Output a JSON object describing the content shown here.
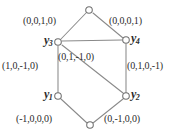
{
  "figure": {
    "type": "labeled-graph-diagram",
    "width": 183,
    "height": 137,
    "background_color": "#ffffff",
    "line_color": "#8a8a8a",
    "node_fill": "#ffffff",
    "node_stroke": "#6f6f6f",
    "text_color": "#2b2b2b"
  },
  "vertices": {
    "y1": {
      "name": "y",
      "subscript": "1",
      "x": 58,
      "y": 96
    },
    "y2": {
      "name": "y",
      "subscript": "2",
      "x": 126,
      "y": 96
    },
    "y3": {
      "name": "y",
      "subscript": "3",
      "x": 58,
      "y": 42
    },
    "y4": {
      "name": "y",
      "subscript": "4",
      "x": 126,
      "y": 40
    },
    "top": {
      "name": "",
      "subscript": "",
      "x": 89,
      "y": 10
    },
    "bottom": {
      "name": "",
      "subscript": "",
      "x": 90,
      "y": 125
    }
  },
  "edges": [
    {
      "id": "top-to-y3",
      "from": "top",
      "to": "y3",
      "label": "(0,0,1,0)"
    },
    {
      "id": "top-to-y4",
      "from": "top",
      "to": "y4",
      "label": "(0,0,0,1)"
    },
    {
      "id": "y3-to-y1",
      "from": "y3",
      "to": "y1",
      "label": "(1,0,-1,0)"
    },
    {
      "id": "y4-to-y2",
      "from": "y4",
      "to": "y2",
      "label": "(0,1,0,-1)"
    },
    {
      "id": "y3-to-y2",
      "from": "y3",
      "to": "y2",
      "label": "(0,1,-1,0)"
    },
    {
      "id": "y1-to-bottom",
      "from": "y1",
      "to": "bottom",
      "label": "(-1,0,0,0)"
    },
    {
      "id": "y2-to-bottom",
      "from": "y2",
      "to": "bottom",
      "label": "(0,-1,0,0)"
    },
    {
      "id": "y3-to-y4",
      "from": "y3",
      "to": "y4",
      "label": ""
    }
  ],
  "labels": {
    "top_left": "(0,0,1,0)",
    "top_right": "(0,0,0,1)",
    "left_side": "(1,0,-1,0)",
    "right_side": "(0,1,0,-1)",
    "diagonal": "(0,1,-1,0)",
    "bottom_left": "(-1,0,0,0)",
    "bottom_right": "(0,-1,0,0)",
    "vertex_y1": "y",
    "vertex_y1_sub": "1",
    "vertex_y2": "y",
    "vertex_y2_sub": "2",
    "vertex_y3": "y",
    "vertex_y3_sub": "3",
    "vertex_y4": "y",
    "vertex_y4_sub": "4"
  }
}
